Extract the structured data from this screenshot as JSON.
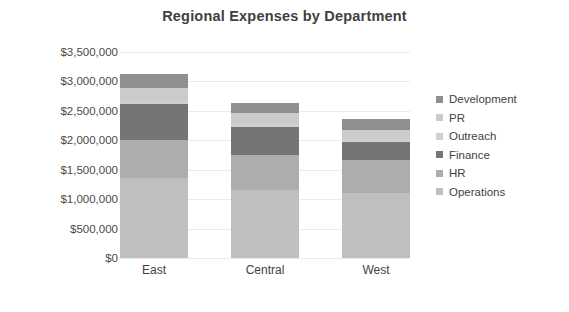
{
  "chart_data": {
    "type": "bar",
    "subtype": "stacked-column",
    "title": "Regional Expenses by Department",
    "xlabel": "",
    "ylabel": "",
    "categories": [
      "East",
      "Central",
      "West"
    ],
    "ylim": [
      0,
      3500000
    ],
    "ytick_values": [
      0,
      500000,
      1000000,
      1500000,
      2000000,
      2500000,
      3000000,
      3500000
    ],
    "ytick_labels": [
      "$0",
      "$500,000",
      "$1,000,000",
      "$1,500,000",
      "$2,000,000",
      "$2,500,000",
      "$3,000,000",
      "$3,500,000"
    ],
    "grid": true,
    "legend_position": "right",
    "stack_order_bottom_to_top": [
      "Operations",
      "HR",
      "Finance",
      "Outreach",
      "PR",
      "Development"
    ],
    "series": [
      {
        "name": "Operations",
        "color": "#bfbfbf",
        "values": [
          1360000,
          1150000,
          1100000
        ]
      },
      {
        "name": "HR",
        "color": "#adadad",
        "values": [
          645000,
          600000,
          560000
        ]
      },
      {
        "name": "Finance",
        "color": "#757575",
        "values": [
          610000,
          480000,
          310000
        ]
      },
      {
        "name": "Outreach",
        "color": "#d0d0d0",
        "values": [
          60000,
          50000,
          50000
        ]
      },
      {
        "name": "PR",
        "color": "#cbcbcb",
        "values": [
          220000,
          185000,
          160000
        ]
      },
      {
        "name": "Development",
        "color": "#8f8f8f",
        "values": [
          225000,
          175000,
          175000
        ]
      }
    ],
    "totals": [
      3120000,
      2640000,
      2355000
    ]
  },
  "legend": {
    "items": [
      {
        "label": "Development",
        "color": "#8f8f8f"
      },
      {
        "label": "PR",
        "color": "#cbcbcb"
      },
      {
        "label": "Outreach",
        "color": "#d0d0d0"
      },
      {
        "label": "Finance",
        "color": "#757575"
      },
      {
        "label": "HR",
        "color": "#adadad"
      },
      {
        "label": "Operations",
        "color": "#bfbfbf"
      }
    ]
  }
}
